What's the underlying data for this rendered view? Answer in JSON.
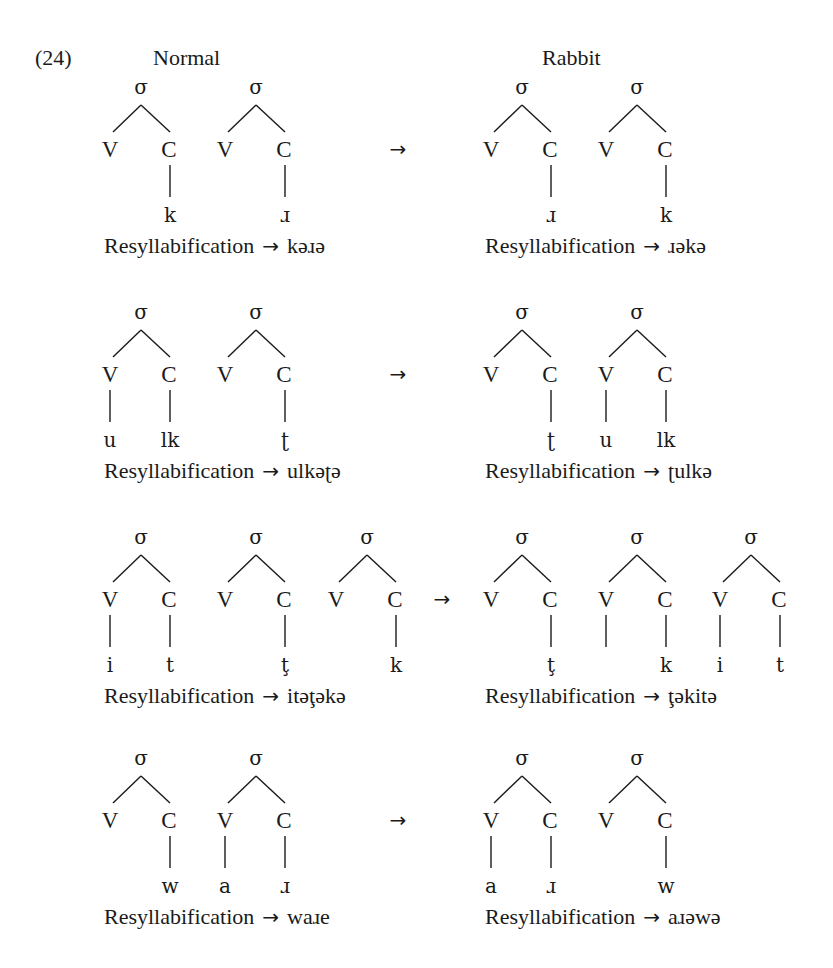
{
  "example_number": "(24)",
  "headers": {
    "left": "Normal",
    "right": "Rabbit"
  },
  "labels": {
    "syllable": "σ",
    "vowel": "V",
    "consonant": "C",
    "arrow": "→",
    "resyllabification": "Resyllabification"
  },
  "rows": [
    {
      "normal": {
        "syllables": [
          {
            "v": "",
            "c": "k",
            "v_line": false,
            "c_line": true
          },
          {
            "v": "",
            "c": "ɹ",
            "v_line": false,
            "c_line": true
          }
        ],
        "result": "kəɹə"
      },
      "rabbit": {
        "syllables": [
          {
            "v": "",
            "c": "ɹ",
            "v_line": false,
            "c_line": true
          },
          {
            "v": "",
            "c": "k",
            "v_line": false,
            "c_line": true
          }
        ],
        "result": "ɹəkə"
      }
    },
    {
      "normal": {
        "syllables": [
          {
            "v": "u",
            "c": "lk",
            "v_line": true,
            "c_line": true
          },
          {
            "v": "",
            "c": "ʈ",
            "v_line": false,
            "c_line": true
          }
        ],
        "result": "ulkəʈə"
      },
      "rabbit": {
        "syllables": [
          {
            "v": "",
            "c": "ʈ",
            "v_line": false,
            "c_line": true
          },
          {
            "v": "u",
            "c": "lk",
            "v_line": true,
            "c_line": true
          }
        ],
        "result": "ʈulkə"
      }
    },
    {
      "normal": {
        "syllables": [
          {
            "v": "i",
            "c": "t",
            "v_line": true,
            "c_line": true
          },
          {
            "v": "",
            "c": "ţ",
            "v_line": false,
            "c_line": true
          },
          {
            "v": "",
            "c": "k",
            "v_line": false,
            "c_line": true
          }
        ],
        "result": "itəţəkə"
      },
      "rabbit": {
        "syllables": [
          {
            "v": "",
            "c": "ţ",
            "v_line": false,
            "c_line": true
          },
          {
            "v": "",
            "c": "k",
            "v_line": true,
            "c_line": true
          },
          {
            "v": "i",
            "c": "t",
            "v_line": true,
            "c_line": true
          }
        ],
        "result": "ţəkitə"
      }
    },
    {
      "normal": {
        "syllables": [
          {
            "v": "",
            "c": "w",
            "v_line": false,
            "c_line": true
          },
          {
            "v": "a",
            "c": "ɹ",
            "v_line": true,
            "c_line": true
          }
        ],
        "result": "waɹe"
      },
      "rabbit": {
        "syllables": [
          {
            "v": "a",
            "c": "ɹ",
            "v_line": true,
            "c_line": true
          },
          {
            "v": "",
            "c": "w",
            "v_line": false,
            "c_line": true
          }
        ],
        "result": "aɹəwə"
      }
    }
  ],
  "colors": {
    "ink": "#1a1a1a",
    "background": "#ffffff"
  }
}
